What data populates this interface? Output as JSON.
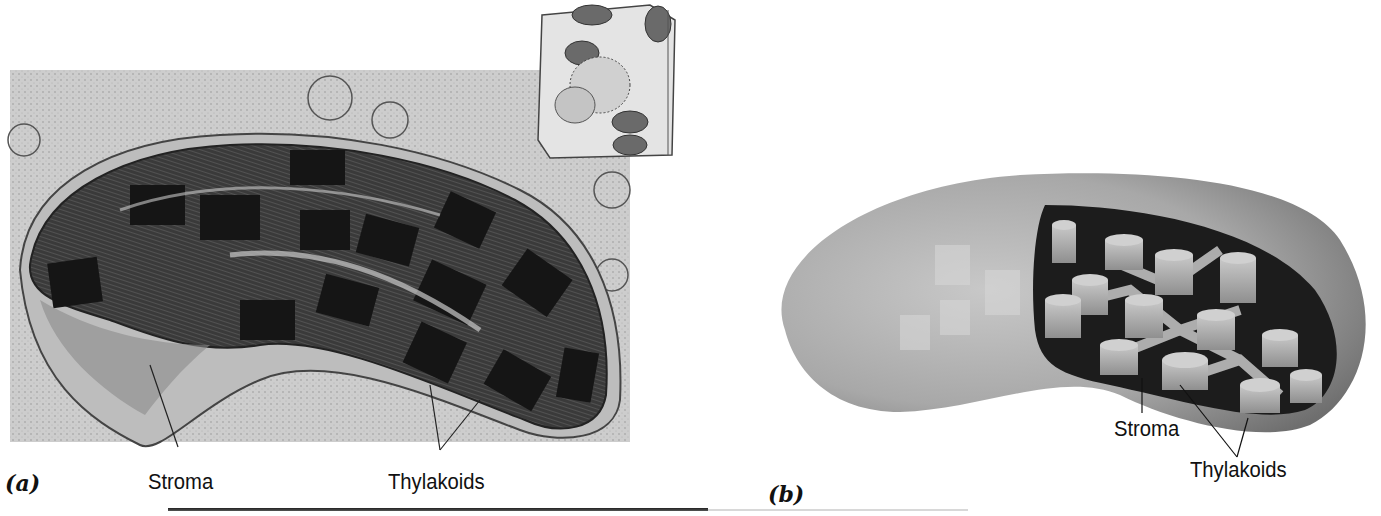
{
  "figure": {
    "panel_a": {
      "letter": "(a)",
      "description": "Electron micrograph of a chloroplast",
      "labels": {
        "stroma": "Stroma",
        "thylakoids": "Thylakoids"
      },
      "inset": "cell-drawing-inset"
    },
    "panel_b": {
      "letter": "(b)",
      "description": "Cutaway illustration of a chloroplast showing grana stacks",
      "labels": {
        "stroma": "Stroma",
        "thylakoids": "Thylakoids"
      }
    }
  },
  "colors": {
    "micrograph_bg": "#cfcfcf",
    "organelle_dark": "#2a2a2a",
    "chloroplast_shell": "#9a9a9a",
    "chloroplast_interior": "#1e1e1e",
    "grana": "#b5b5b5",
    "text": "#111111"
  }
}
